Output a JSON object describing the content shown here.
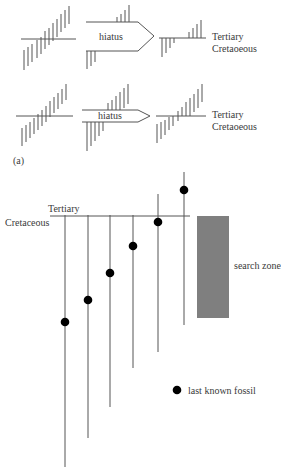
{
  "panel_a": {
    "label": "(a)",
    "rows": [
      {
        "hiatus_label": "hiatus",
        "boundary_top": "Tertiary",
        "boundary_bottom": "Cretaoeous"
      },
      {
        "hiatus_label": "hiatus",
        "boundary_top": "Tertiary",
        "boundary_bottom": "Cretaoeous"
      }
    ]
  },
  "panel_b": {
    "boundary_top": "Tertiary",
    "boundary_bottom": "Cretaceous",
    "search_zone_label": "search zone",
    "search_zone_color": "#7f7f7f",
    "legend": {
      "marker": "filled-circle",
      "label": "last known fossil"
    },
    "lineages": [
      {
        "x": 65,
        "top": 215,
        "bottom": 467,
        "fossil_y": 322
      },
      {
        "x": 88,
        "top": 215,
        "bottom": 438,
        "fossil_y": 300
      },
      {
        "x": 110,
        "top": 215,
        "bottom": 407,
        "fossil_y": 273
      },
      {
        "x": 133,
        "top": 215,
        "bottom": 368,
        "fossil_y": 246
      },
      {
        "x": 158,
        "top": 194,
        "bottom": 352,
        "fossil_y": 222
      },
      {
        "x": 184,
        "top": 172,
        "bottom": 325,
        "fossil_y": 190
      }
    ]
  }
}
